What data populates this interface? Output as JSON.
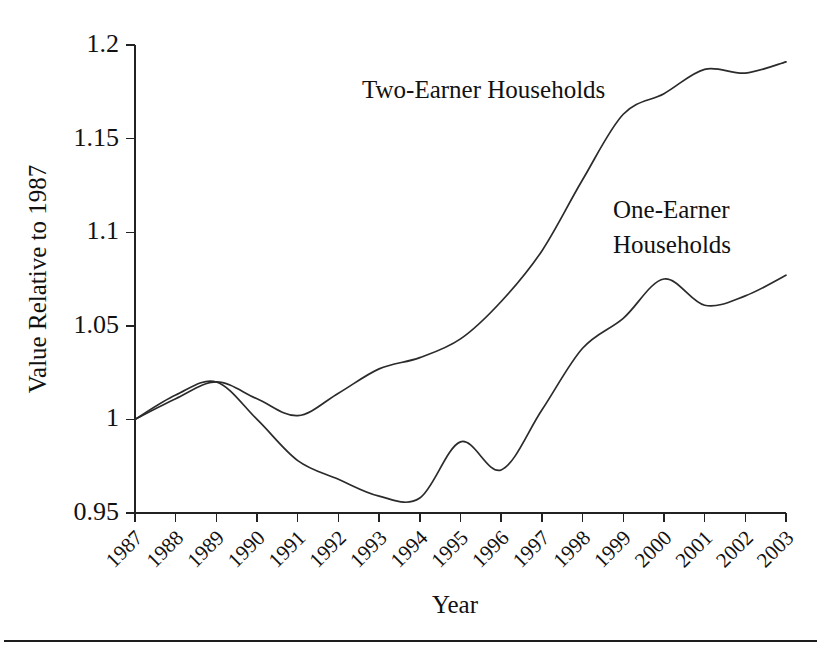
{
  "figure": {
    "background_color": "#ffffff",
    "line_color": "#2b2b2b",
    "axis_color": "#222222",
    "bottom_rule": true
  },
  "chart_data": {
    "type": "line",
    "title": "",
    "xlabel": "Year",
    "ylabel": "Value Relative to 1987",
    "x": [
      1987,
      1988,
      1989,
      1990,
      1991,
      1992,
      1993,
      1994,
      1995,
      1996,
      1997,
      1998,
      1999,
      2000,
      2001,
      2002,
      2003
    ],
    "categories": [
      "1987",
      "1988",
      "1989",
      "1990",
      "1991",
      "1992",
      "1993",
      "1994",
      "1995",
      "1996",
      "1997",
      "1998",
      "1999",
      "2000",
      "2001",
      "2002",
      "2003"
    ],
    "xlim": [
      1987,
      2003
    ],
    "ylim": [
      0.95,
      1.2
    ],
    "yticks": [
      0.95,
      1,
      1.05,
      1.1,
      1.15,
      1.2
    ],
    "ytick_labels": [
      "0.95",
      "1",
      "1.05",
      "1.1",
      "1.15",
      "1.2"
    ],
    "xtick_labels": [
      "1987",
      "1988",
      "1989",
      "1990",
      "1991",
      "1992",
      "1993",
      "1994",
      "1995",
      "1996",
      "1997",
      "1998",
      "1999",
      "2000",
      "2001",
      "2002",
      "2003"
    ],
    "xtick_rotation_deg": 45,
    "grid": false,
    "legend": "inline-annotations",
    "series": [
      {
        "name": "Two-Earner Households",
        "color": "#2b2b2b",
        "values": [
          1.0,
          1.011,
          1.02,
          1.011,
          1.002,
          1.014,
          1.027,
          1.033,
          1.043,
          1.063,
          1.09,
          1.128,
          1.163,
          1.174,
          1.187,
          1.185,
          1.191
        ]
      },
      {
        "name": "One-Earner Households",
        "color": "#2b2b2b",
        "values": [
          1.0,
          1.013,
          1.02,
          1.0,
          0.978,
          0.968,
          0.959,
          0.958,
          0.988,
          0.973,
          1.005,
          1.038,
          1.054,
          1.075,
          1.061,
          1.066,
          1.077
        ]
      }
    ],
    "annotations": [
      {
        "id": "two-earner-label",
        "text": "Two-Earner Households",
        "lines": [
          "Two-Earner Households"
        ],
        "x_px": 362,
        "y_px": 98
      },
      {
        "id": "one-earner-label",
        "text": "One-Earner Households",
        "lines": [
          "One-Earner",
          "Households"
        ],
        "x_px": 613,
        "y_px": 218
      }
    ]
  }
}
